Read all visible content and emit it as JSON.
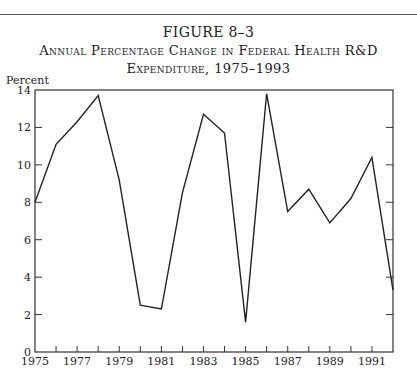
{
  "figure": {
    "label": "FIGURE 8–3",
    "title_line1": "Annual Percentage Change in Federal Health R&D",
    "title_line2": "Expenditure, 1975–1993"
  },
  "chart_data": {
    "type": "line",
    "xlabel": "",
    "ylabel": "Percent",
    "x": [
      1975,
      1976,
      1977,
      1978,
      1979,
      1980,
      1981,
      1982,
      1983,
      1984,
      1985,
      1986,
      1987,
      1988,
      1989,
      1990,
      1991,
      1992
    ],
    "series": [
      {
        "name": "Annual percentage change",
        "values": [
          8.0,
          11.1,
          12.3,
          13.7,
          9.2,
          2.5,
          2.3,
          8.5,
          12.7,
          11.7,
          1.6,
          13.8,
          7.5,
          8.7,
          6.9,
          8.2,
          10.4,
          3.3
        ]
      }
    ],
    "xlim": [
      1975,
      1992
    ],
    "ylim": [
      0,
      14
    ],
    "x_tick_labels": [
      "1975",
      "1977",
      "1979",
      "1981",
      "1983",
      "1985",
      "1987",
      "1989",
      "1991"
    ],
    "y_tick_labels": [
      "0",
      "2",
      "4",
      "6",
      "8",
      "10",
      "12",
      "14"
    ],
    "grid": false,
    "legend": "none",
    "line_color": "#222222"
  }
}
